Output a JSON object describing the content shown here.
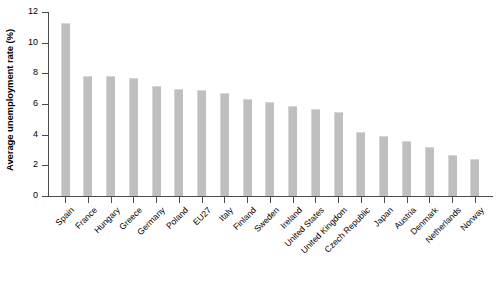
{
  "chart_data": {
    "type": "bar",
    "title": "",
    "subtitle": "",
    "xlabel": "",
    "ylabel": "Average unemployment rate (%)",
    "ylim": [
      0,
      12
    ],
    "yticks": [
      0,
      2,
      4,
      6,
      8,
      10,
      12
    ],
    "ytick_labels": [
      "0",
      "2",
      "4",
      "6",
      "8",
      "10",
      "12"
    ],
    "grid": false,
    "legend": null,
    "bar_color": "#bfbfbf",
    "axis_color": "#4a4a4a",
    "categories": [
      "Spain",
      "France",
      "Hungary",
      "Greece",
      "Germany",
      "Poland",
      "EU27",
      "Italy",
      "Finland",
      "Sweden",
      "Ireland",
      "United States",
      "United Kingdom",
      "Czech Republic",
      "Japan",
      "Austria",
      "Denmark",
      "Netherlands",
      "Norway"
    ],
    "values": [
      11.3,
      7.8,
      7.8,
      7.7,
      7.2,
      7.0,
      6.9,
      6.7,
      6.3,
      6.1,
      5.9,
      5.7,
      5.5,
      4.2,
      3.9,
      3.6,
      3.2,
      2.7,
      2.4
    ]
  }
}
